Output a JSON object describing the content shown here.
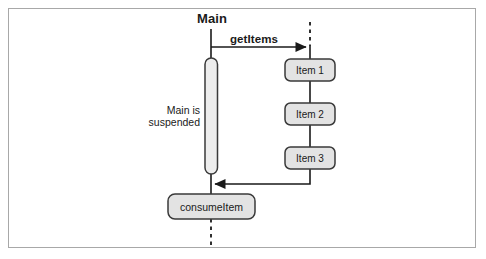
{
  "diagram": {
    "type": "uml-sequence-diagram",
    "title_label": "Main",
    "colors": {
      "frame_border": "#a8a8a8",
      "line": "#1a1a1a",
      "box_fill": "#e3e3e3",
      "box_border": "#3a3a3a",
      "activation_fill": "#ededed",
      "background": "#ffffff"
    },
    "lifelines": [
      {
        "name": "main-lifeline",
        "label": "Main",
        "x": 211,
        "dashed_top": false
      },
      {
        "name": "producer-lifeline",
        "label": "",
        "x": 310,
        "dashed_top": true
      }
    ],
    "messages": [
      {
        "name": "getitems-message",
        "label": "getItems",
        "direction": "right",
        "style": "solid",
        "from": "Main",
        "to": "producer"
      },
      {
        "name": "return-message",
        "label": "",
        "direction": "left",
        "style": "solid",
        "from": "producer",
        "to": "Main"
      }
    ],
    "activation": {
      "name": "main-activation-bar",
      "note": "Main is suspended",
      "note_lines": [
        "Main is",
        "suspended"
      ]
    },
    "item_boxes": [
      {
        "label": "Item 1"
      },
      {
        "label": "Item 2"
      },
      {
        "label": "Item 3"
      }
    ],
    "result_box": {
      "label": "consumeItem"
    }
  }
}
